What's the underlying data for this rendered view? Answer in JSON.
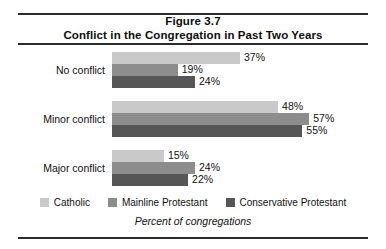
{
  "figure": {
    "title_line1": "Figure 3.7",
    "title_line2": "Conflict in the Congregation in Past Two Years",
    "axis_caption": "Percent of congregations"
  },
  "colors": {
    "series_catholic": "#c9c9c9",
    "series_mainline": "#8d8d8d",
    "series_conservative": "#565656",
    "rule": "#2b2b2b",
    "text": "#111111"
  },
  "legend": {
    "items": [
      {
        "label": "Catholic",
        "color": "#c9c9c9"
      },
      {
        "label": "Mainline Protestant",
        "color": "#8d8d8d"
      },
      {
        "label": "Conservative Protestant",
        "color": "#565656"
      }
    ]
  },
  "chart_data": {
    "type": "bar",
    "orientation": "horizontal",
    "xlabel": "Percent of congregations",
    "ylabel": "",
    "categories": [
      "No conflict",
      "Minor conflict",
      "Major conflict"
    ],
    "series": [
      {
        "name": "Catholic",
        "values": [
          37,
          48,
          15
        ],
        "color": "#c9c9c9"
      },
      {
        "name": "Mainline Protestant",
        "values": [
          19,
          57,
          24
        ],
        "color": "#8d8d8d"
      },
      {
        "name": "Conservative Protestant",
        "values": [
          24,
          55,
          22
        ],
        "color": "#565656"
      }
    ],
    "value_labels": [
      [
        "37%",
        "19%",
        "24%"
      ],
      [
        "48%",
        "57%",
        "55%"
      ],
      [
        "15%",
        "24%",
        "22%"
      ]
    ],
    "xlim": [
      0,
      60
    ],
    "grid": false,
    "legend_position": "bottom"
  },
  "groups": [
    {
      "label": "No conflict",
      "rows": [
        {
          "value": 37,
          "label": "37%",
          "series": 0
        },
        {
          "value": 19,
          "label": "19%",
          "series": 1
        },
        {
          "value": 24,
          "label": "24%",
          "series": 2
        }
      ]
    },
    {
      "label": "Minor conflict",
      "rows": [
        {
          "value": 48,
          "label": "48%",
          "series": 0
        },
        {
          "value": 57,
          "label": "57%",
          "series": 1
        },
        {
          "value": 55,
          "label": "55%",
          "series": 2
        }
      ]
    },
    {
      "label": "Major conflict",
      "rows": [
        {
          "value": 15,
          "label": "15%",
          "series": 0
        },
        {
          "value": 24,
          "label": "24%",
          "series": 1
        },
        {
          "value": 22,
          "label": "22%",
          "series": 2
        }
      ]
    }
  ]
}
